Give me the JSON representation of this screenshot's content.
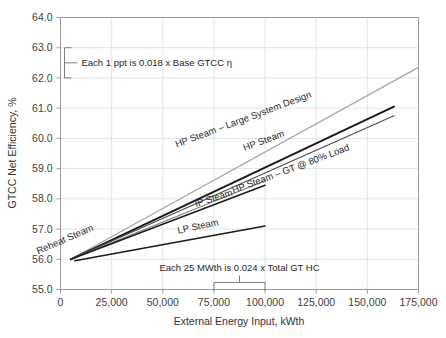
{
  "chart_data": {
    "type": "line",
    "title": "",
    "xlabel": "External Energy Input, kWth",
    "ylabel": "GTCC Net Efficiency, %",
    "xlim": [
      0,
      175000
    ],
    "ylim": [
      55.0,
      64.0
    ],
    "grid": true,
    "legend": "inline-labels",
    "xticks": [
      0,
      25000,
      50000,
      75000,
      100000,
      125000,
      150000,
      175000
    ],
    "xticklabels": [
      "0",
      "25,000",
      "50,000",
      "75,000",
      "100,000",
      "125,000",
      "150,000",
      "175,000"
    ],
    "yticks": [
      55.0,
      56.0,
      57.0,
      58.0,
      59.0,
      60.0,
      61.0,
      62.0,
      63.0,
      64.0
    ],
    "yticklabels": [
      "55.0",
      "56.0",
      "57.0",
      "58.0",
      "59.0",
      "60.0",
      "61.0",
      "62.0",
      "63.0",
      "64.0"
    ],
    "series": [
      {
        "name": "HP Steam – Large System Design",
        "color": "#a6a6a6",
        "width": 1.2,
        "points": [
          [
            5000,
            56.0
          ],
          [
            175000,
            62.35
          ]
        ]
      },
      {
        "name": "HP Steam",
        "color": "#1a1a1a",
        "width": 2.0,
        "points": [
          [
            5000,
            56.0
          ],
          [
            163000,
            61.05
          ]
        ]
      },
      {
        "name": "HP Steam – GT @ 80% Load",
        "color": "#4d4d4d",
        "width": 1.2,
        "points": [
          [
            5000,
            56.0
          ],
          [
            163000,
            60.75
          ]
        ]
      },
      {
        "name": "Reheat Steam",
        "color": "#808080",
        "width": 1.2,
        "points": [
          [
            5000,
            56.0
          ],
          [
            100000,
            58.6
          ]
        ]
      },
      {
        "name": "IP Steam",
        "color": "#1a1a1a",
        "width": 1.5,
        "points": [
          [
            5000,
            56.0
          ],
          [
            100000,
            58.45
          ]
        ]
      },
      {
        "name": "LP Steam",
        "color": "#1a1a1a",
        "width": 1.5,
        "points": [
          [
            7000,
            55.95
          ],
          [
            100000,
            57.1
          ]
        ]
      }
    ],
    "series_labels": [
      {
        "key": "hp-large",
        "text": "HP Steam – Large System Design",
        "x": 312,
        "y": 97,
        "rotate": -20.5
      },
      {
        "key": "hp-steam",
        "text": "HP Steam",
        "x": 285,
        "y": 136,
        "rotate": -20.5
      },
      {
        "key": "hp-gt80",
        "text": "HP Steam – GT @ 80% Load",
        "x": 350,
        "y": 150,
        "rotate": -20.5
      },
      {
        "key": "reheat-steam",
        "text": "Reheat Steam",
        "x": 94,
        "y": 230,
        "rotate": -23.5
      },
      {
        "key": "ip-steam",
        "text": "IP Steam",
        "x": 233,
        "y": 195,
        "rotate": -18.0
      },
      {
        "key": "lp-steam",
        "text": "LP Steam",
        "x": 219,
        "y": 225,
        "rotate": -12.0
      }
    ],
    "annotations": [
      {
        "key": "ppt-annotation",
        "text": "Each 1 ppt is 0.018 x Base GTCC η",
        "bracket": "vertical",
        "from_value": 63.0,
        "to_value": 62.0
      },
      {
        "key": "mwth-annotation",
        "text": "Each 25 MWth is 0.024 x Total GT HC",
        "bracket": "horizontal",
        "from_value": 75000,
        "to_value": 100000
      }
    ]
  }
}
